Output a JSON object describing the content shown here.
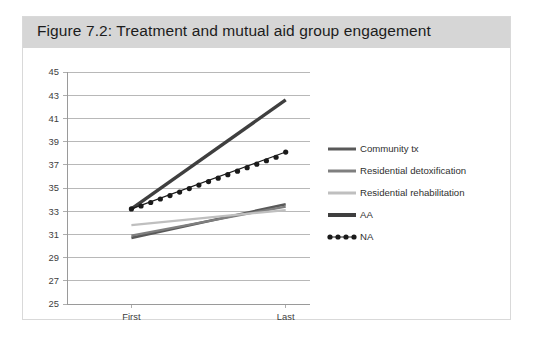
{
  "figure": {
    "title": "Figure 7.2: Treatment and mutual aid group engagement"
  },
  "colors": {
    "title_bar": "#d6d6d6",
    "card_border": "#d9d9d9",
    "gridline": "#a6a6a6",
    "axis": "#9a9a9a",
    "tick_text": "#404040",
    "community_tx": "#595959",
    "residential_detoxification": "#7f7f7f",
    "residential_rehabilitation": "#bfbfbf",
    "aa": "#3f3f3f",
    "na": "#1a1a1a"
  },
  "legend": {
    "position": "right",
    "items": [
      {
        "label": "Community tx",
        "color": "#595959",
        "style": "solid",
        "marker": "none",
        "width": 3
      },
      {
        "label": "Residential detoxification",
        "color": "#7f7f7f",
        "style": "solid",
        "marker": "none",
        "width": 3
      },
      {
        "label": "Residential rehabilitation",
        "color": "#bfbfbf",
        "style": "solid",
        "marker": "none",
        "width": 3
      },
      {
        "label": "AA",
        "color": "#3f3f3f",
        "style": "solid",
        "marker": "none",
        "width": 4
      },
      {
        "label": "NA",
        "color": "#1a1a1a",
        "style": "solid",
        "marker": "circle",
        "width": 1
      }
    ]
  },
  "chart_data": {
    "type": "line",
    "title": "Figure 7.2: Treatment and mutual aid group engagement",
    "xlabel": "",
    "ylabel": "",
    "categories": [
      "First",
      "Last"
    ],
    "x_tick_labels": [
      "First",
      "Last"
    ],
    "y_tick_labels": [
      "25",
      "27",
      "29",
      "31",
      "33",
      "35",
      "37",
      "39",
      "41",
      "43",
      "45"
    ],
    "ylim": [
      25,
      45
    ],
    "ytick_step": 2,
    "grid": "horizontal",
    "legend_position": "right",
    "series": [
      {
        "name": "Community tx",
        "values": [
          30.7,
          33.6
        ],
        "color": "#595959",
        "marker": "none"
      },
      {
        "name": "Residential detoxification",
        "values": [
          30.9,
          33.4
        ],
        "color": "#7f7f7f",
        "marker": "none"
      },
      {
        "name": "Residential rehabilitation",
        "values": [
          31.8,
          33.1
        ],
        "color": "#bfbfbf",
        "marker": "none"
      },
      {
        "name": "AA",
        "values": [
          33.2,
          42.6
        ],
        "color": "#3f3f3f",
        "marker": "none"
      },
      {
        "name": "NA",
        "values": [
          33.2,
          38.1
        ],
        "color": "#1a1a1a",
        "marker": "circle",
        "marker_points": [
          33.2,
          33.45,
          33.75,
          34.05,
          34.35,
          34.65,
          34.95,
          35.25,
          35.55,
          35.85,
          36.15,
          36.45,
          36.75,
          37.05,
          37.35,
          37.65,
          38.1
        ]
      }
    ]
  }
}
